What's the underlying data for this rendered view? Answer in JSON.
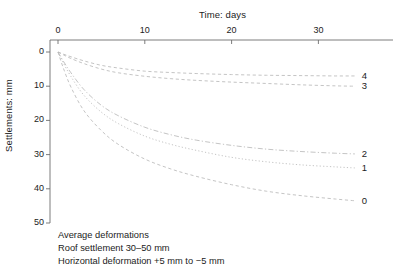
{
  "chart_data": {
    "type": "line",
    "title": "",
    "xlabel": "Time: days",
    "ylabel": "Settlements: mm",
    "xlim": [
      0,
      38.5
    ],
    "ylim": [
      0,
      50
    ],
    "y_inverted": true,
    "grid": false,
    "legend_position": "right-endpoint-labels",
    "x_ticks": [
      0,
      10,
      20,
      30
    ],
    "x_tick_labels": [
      "0",
      "10",
      "20",
      "30"
    ],
    "y_ticks": [
      0,
      10,
      20,
      30,
      40,
      50
    ],
    "y_tick_labels": [
      "0",
      "10",
      "20",
      "30",
      "40",
      "50"
    ],
    "series": [
      {
        "name": "4",
        "label": "4",
        "linestyle": "dashed",
        "x": [
          0,
          0.6,
          1.5,
          3,
          5,
          7,
          10,
          13,
          16,
          20,
          24,
          28,
          32,
          34.2
        ],
        "values": [
          0,
          0.6,
          1.4,
          2.6,
          3.9,
          4.7,
          5.6,
          6.0,
          6.3,
          6.6,
          6.8,
          6.9,
          7.0,
          7.0
        ]
      },
      {
        "name": "3",
        "label": "3",
        "linestyle": "dashed",
        "x": [
          0,
          0.6,
          1.5,
          3,
          5,
          7,
          10,
          13,
          16,
          20,
          24,
          28,
          32,
          34.2
        ],
        "values": [
          0,
          0.8,
          1.9,
          3.4,
          5.0,
          6.1,
          7.1,
          7.8,
          8.3,
          8.8,
          9.2,
          9.6,
          9.9,
          10.0
        ]
      },
      {
        "name": "2",
        "label": "2",
        "linestyle": "dash-dot",
        "x": [
          0,
          0.6,
          1.5,
          3,
          5,
          7,
          10,
          13,
          16,
          20,
          24,
          28,
          32,
          34.2
        ],
        "values": [
          0,
          2.6,
          6.1,
          11.0,
          15.6,
          18.7,
          22.0,
          24.2,
          25.8,
          27.3,
          28.4,
          29.1,
          29.6,
          29.8
        ]
      },
      {
        "name": "1",
        "label": "1",
        "linestyle": "dotted",
        "x": [
          0,
          0.6,
          1.5,
          3,
          5,
          7,
          10,
          13,
          16,
          20,
          24,
          28,
          32,
          34.2
        ],
        "values": [
          0,
          3.1,
          7.2,
          12.7,
          17.6,
          21.0,
          24.6,
          27.0,
          28.8,
          30.8,
          32.1,
          33.0,
          33.6,
          33.9
        ]
      },
      {
        "name": "0",
        "label": "0",
        "linestyle": "dashed",
        "x": [
          0,
          0.6,
          1.5,
          3,
          5,
          7,
          10,
          13,
          16,
          20,
          24,
          28,
          32,
          34.2
        ],
        "values": [
          0,
          4.6,
          10.3,
          17.2,
          23.0,
          27.1,
          31.3,
          34.2,
          36.4,
          38.8,
          40.7,
          42.0,
          43.0,
          43.5
        ]
      }
    ]
  },
  "axes": {
    "x_title": "Time: days",
    "y_title": "Settlements: mm"
  },
  "x_tick_labels": [
    "0",
    "10",
    "20",
    "30"
  ],
  "y_tick_labels": [
    "0",
    "10",
    "20",
    "30",
    "40",
    "50"
  ],
  "series_labels": [
    "0",
    "1",
    "2",
    "3",
    "4"
  ],
  "caption": {
    "line1": "Average deformations",
    "line2": "Roof settlement 30–50 mm",
    "line3": "Horizontal deformation +5 mm to −5 mm"
  },
  "colors": {
    "axis": "#6e6e6e",
    "curve": "#b9b9b9",
    "text": "#1c1c1c"
  }
}
